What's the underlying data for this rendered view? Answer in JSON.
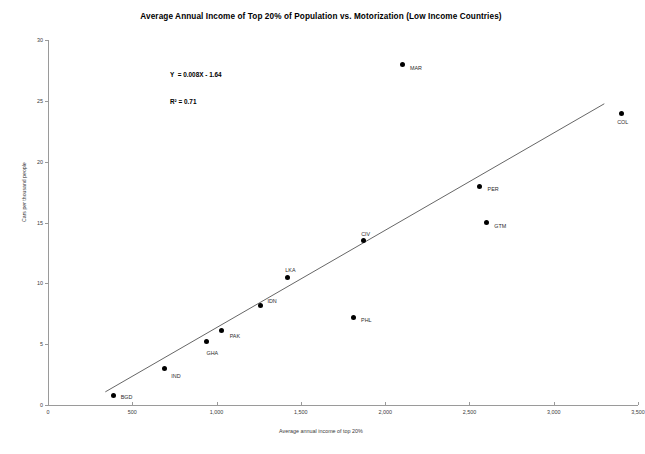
{
  "chart_data": {
    "type": "scatter",
    "title": "Average Annual Income of Top 20% of Population vs. Motorization (Low Income Countries)",
    "xlabel": "Average annual income of top 20%",
    "ylabel": "Cars per thousand people",
    "xlim": [
      0,
      3500
    ],
    "ylim": [
      0,
      30
    ],
    "grid": false,
    "legend": null,
    "xticks": [
      "0",
      "500",
      "1,000",
      "1,500",
      "2,000",
      "2,500",
      "3,000",
      "3,500"
    ],
    "xtick_values": [
      0,
      500,
      1000,
      1500,
      2000,
      2500,
      3000,
      3500
    ],
    "yticks": [
      "0",
      "5",
      "10",
      "15",
      "20",
      "25",
      "30"
    ],
    "ytick_values": [
      0,
      5,
      10,
      15,
      20,
      25,
      30
    ],
    "annotations": {
      "equation": "Y  = 0.008X - 1.64",
      "r_squared": "R² = 0.71"
    },
    "trendline": {
      "slope": 0.008,
      "intercept": -1.64,
      "r2": 0.71,
      "x_start": 340,
      "x_end": 3300
    },
    "points": [
      {
        "label": "BGD",
        "x": 390,
        "y": 0.8,
        "label_dx": 7,
        "label_dy": 2
      },
      {
        "label": "IND",
        "x": 690,
        "y": 3.0,
        "label_dx": 7,
        "label_dy": 7
      },
      {
        "label": "GHA",
        "x": 940,
        "y": 5.2,
        "label_dx": 0,
        "label_dy": 11
      },
      {
        "label": "PAK",
        "x": 1030,
        "y": 6.1,
        "label_dx": 8,
        "label_dy": 5
      },
      {
        "label": "IDN",
        "x": 1260,
        "y": 8.2,
        "label_dx": 7,
        "label_dy": -4
      },
      {
        "label": "LKA",
        "x": 1420,
        "y": 10.5,
        "label_dx": -2,
        "label_dy": -7
      },
      {
        "label": "PHL",
        "x": 1810,
        "y": 7.2,
        "label_dx": 8,
        "label_dy": 3
      },
      {
        "label": "CIV",
        "x": 1870,
        "y": 13.5,
        "label_dx": -2,
        "label_dy": -7
      },
      {
        "label": "MAR",
        "x": 2100,
        "y": 28.0,
        "label_dx": 8,
        "label_dy": 4
      },
      {
        "label": "PER",
        "x": 2560,
        "y": 18.0,
        "label_dx": 8,
        "label_dy": 3
      },
      {
        "label": "GTM",
        "x": 2600,
        "y": 15.0,
        "label_dx": 8,
        "label_dy": 3
      },
      {
        "label": "COL",
        "x": 3400,
        "y": 24.0,
        "label_dx": -4,
        "label_dy": 9
      }
    ]
  },
  "style": {
    "point_color": "#000000",
    "axis_color": "#9a9a9a",
    "trendline_color": "#3f3f3f",
    "text_color": "#2b2b2b",
    "background": "#ffffff"
  }
}
